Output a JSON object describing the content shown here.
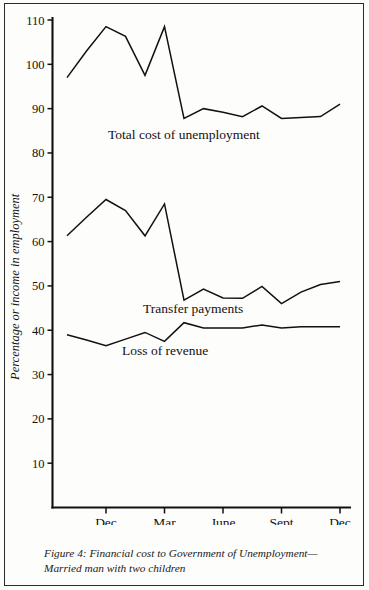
{
  "figure": {
    "caption": "Figure 4: Financial cost to Government of Unemployment—Married man with two children",
    "y_axis_title": "Percentage or income in employment"
  },
  "chart_data": {
    "type": "line",
    "title": "",
    "xlabel": "",
    "ylabel": "Percentage or income in employment",
    "ylim": [
      0,
      110
    ],
    "yticks": [
      10,
      20,
      30,
      40,
      50,
      60,
      70,
      80,
      90,
      100,
      110
    ],
    "grid": false,
    "legend": "inline-annotations",
    "x": [
      "Oct 1977",
      "Nov 1977",
      "Dec 1977",
      "Jan 1978",
      "Feb 1978",
      "Mar 1978",
      "Apr 1978",
      "May 1978",
      "June 1978",
      "July 1978",
      "Aug 1978",
      "Sept 1978",
      "Oct 1978",
      "Nov 1978",
      "Dec 1978"
    ],
    "xticks": [
      {
        "label": "Dec",
        "sublabel": "1977",
        "x": "Dec 1977"
      },
      {
        "label": "Mar",
        "sublabel": "",
        "x": "Mar 1978"
      },
      {
        "label": "June",
        "sublabel": "1978",
        "x": "June 1978"
      },
      {
        "label": "Sept",
        "sublabel": "",
        "x": "Sept 1978"
      },
      {
        "label": "Dec",
        "sublabel": "",
        "x": "Dec 1978"
      }
    ],
    "series": [
      {
        "name": "Total cost of unemployment",
        "values": [
          97.0,
          103.0,
          108.5,
          106.3,
          97.5,
          108.5,
          87.8,
          90.0,
          89.2,
          88.2,
          90.6,
          87.8,
          88.0,
          88.2,
          91.0
        ]
      },
      {
        "name": "Transfer payments",
        "values": [
          61.3,
          65.5,
          69.5,
          67.0,
          61.3,
          68.5,
          46.8,
          49.3,
          47.3,
          47.2,
          49.9,
          46.0,
          48.6,
          50.3,
          51.0
        ]
      },
      {
        "name": "Loss of revenue",
        "values": [
          39.0,
          37.8,
          36.5,
          38.0,
          39.5,
          37.5,
          41.7,
          40.5,
          40.5,
          40.5,
          41.2,
          40.5,
          40.8,
          40.8,
          40.8
        ]
      }
    ],
    "annotations": [
      {
        "text": "Total cost of unemployment",
        "series": "Total cost of unemployment"
      },
      {
        "text": "Transfer payments",
        "series": "Transfer payments"
      },
      {
        "text": "Loss of revenue",
        "series": "Loss of revenue"
      }
    ]
  }
}
